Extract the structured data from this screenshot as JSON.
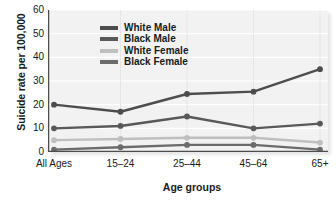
{
  "chart_data": {
    "type": "line",
    "title": "",
    "xlabel": "Age groups",
    "ylabel": "Suicide rate per 100,000",
    "categories": [
      "All Ages",
      "15–24",
      "25–44",
      "45–64",
      "65+"
    ],
    "yticks": [
      0,
      10,
      20,
      30,
      40,
      50,
      60
    ],
    "ylim": [
      0,
      60
    ],
    "grid": true,
    "legend_position": "upper-left-inside",
    "series": [
      {
        "name": "White Male",
        "values": [
          20,
          17,
          24.5,
          25.5,
          35
        ],
        "color": "#4d4d4d"
      },
      {
        "name": "Black Male",
        "values": [
          10,
          11,
          15,
          10,
          12
        ],
        "color": "#595959"
      },
      {
        "name": "White Female",
        "values": [
          5,
          5.5,
          6,
          6,
          4
        ],
        "color": "#bfbfbf"
      },
      {
        "name": "Black Female",
        "values": [
          1,
          2,
          3,
          3,
          1
        ],
        "color": "#6b6b6b"
      }
    ]
  },
  "axis": {
    "y_title": "Suicide rate per 100,000",
    "x_title": "Age groups",
    "y_tick_labels": [
      "60",
      "50",
      "40",
      "30",
      "20",
      "10",
      "0"
    ],
    "x_tick_labels": [
      "All Ages",
      "15–24",
      "25–44",
      "45–64",
      "65+"
    ]
  },
  "legend": {
    "items": [
      {
        "label": "White Male"
      },
      {
        "label": "Black Male"
      },
      {
        "label": "White Female"
      },
      {
        "label": "Black Female"
      }
    ]
  },
  "colors": {
    "plot_background": "#f2f2f2",
    "gridline": "#ffffff",
    "axis": "#4d4d4d",
    "white_male": "#4d4d4d",
    "black_male": "#595959",
    "white_female": "#bfbfbf",
    "black_female": "#6b6b6b"
  }
}
